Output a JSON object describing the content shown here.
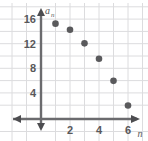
{
  "chart_data": {
    "type": "scatter",
    "title": "",
    "xlabel": "n",
    "ylabel": "a_n",
    "ylabel_base": "a",
    "ylabel_sub": "n",
    "x": [
      1,
      2,
      3,
      4,
      5,
      6
    ],
    "values": [
      15.5,
      14.5,
      12.3,
      9.8,
      6.2,
      2.2
    ],
    "points": [
      {
        "n": 1,
        "a": 15.5
      },
      {
        "n": 2,
        "a": 14.5
      },
      {
        "n": 3,
        "a": 12.3
      },
      {
        "n": 4,
        "a": 9.8
      },
      {
        "n": 5,
        "a": 6.2
      },
      {
        "n": 6,
        "a": 2.2
      }
    ],
    "xlim": [
      -0.6,
      7.2
    ],
    "ylim": [
      -1.2,
      17.2
    ],
    "xticks": [
      2,
      4,
      6
    ],
    "xtick_labels": [
      "2",
      "4",
      "6"
    ],
    "yticks": [
      4,
      8,
      12,
      16
    ],
    "ytick_labels": [
      "4",
      "8",
      "12",
      "16"
    ],
    "grid": true,
    "grid_step_x": 1,
    "grid_step_y": 2,
    "legend": null,
    "legend_position": "none",
    "axis_arrows": [
      "left",
      "right",
      "up",
      "down"
    ],
    "colors": {
      "point": "#5a5a5c",
      "grid": "#d8d8da",
      "axis": "#6b6b6e",
      "text": "#58585a",
      "background": "#ffffff"
    }
  },
  "labels": {
    "ytick_16": "16",
    "ytick_12": "12",
    "ytick_8": "8",
    "ytick_4": "4",
    "xtick_2": "2",
    "xtick_4": "4",
    "xtick_6": "6",
    "y_axis_name": "a",
    "y_axis_name_sub": "n",
    "x_axis_name": "n"
  }
}
